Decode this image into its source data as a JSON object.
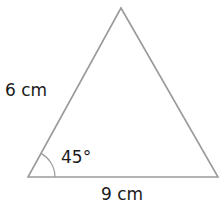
{
  "diagram": {
    "type": "triangle",
    "colors": {
      "stroke": "#9a9a9a",
      "text": "#1a1a1a",
      "background": "#ffffff"
    },
    "vertices": {
      "top": {
        "x": 121,
        "y": 8
      },
      "bottom_left": {
        "x": 28,
        "y": 177
      },
      "bottom_right": {
        "x": 218,
        "y": 177
      }
    },
    "labels": {
      "left_side": "6 cm",
      "base": "9 cm",
      "angle": "45°"
    },
    "angle_marker": {
      "vertex": "bottom_left",
      "radius": 27
    }
  }
}
